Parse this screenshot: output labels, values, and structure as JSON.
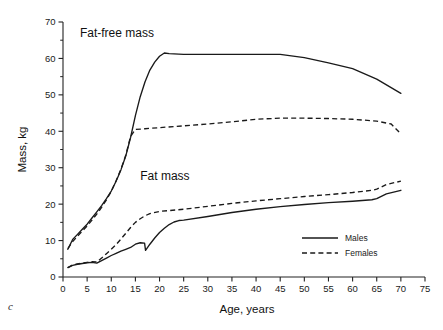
{
  "figure": {
    "panel_label": "c"
  },
  "chart_data": {
    "type": "line",
    "title": "",
    "xlabel": "Age, years",
    "ylabel": "Mass, kg",
    "xlim": [
      0,
      75
    ],
    "ylim": [
      0,
      70
    ],
    "x_major_ticks": [
      0,
      5,
      10,
      15,
      20,
      25,
      30,
      35,
      40,
      45,
      50,
      55,
      60,
      65,
      70,
      75
    ],
    "y_major_ticks": [
      0,
      10,
      20,
      30,
      40,
      50,
      60,
      70
    ],
    "y_minor_ticks": [
      5,
      15,
      25,
      35,
      45,
      55,
      65
    ],
    "grid": false,
    "legend_position": "bottom-right",
    "legend": [
      {
        "name": "Males",
        "style": "solid"
      },
      {
        "name": "Females",
        "style": "dashed"
      }
    ],
    "annotations": [
      {
        "text": "Fat-free mass",
        "x": 3.5,
        "y": 66.0
      },
      {
        "text": "Fat mass",
        "x": 16.0,
        "y": 26.5
      }
    ],
    "series": [
      {
        "name": "Fat-free mass, Males",
        "group": "Fat-free mass",
        "sex": "Males",
        "style": "solid",
        "x": [
          1,
          2,
          3,
          4,
          5,
          6,
          7,
          8,
          9,
          10,
          11,
          12,
          13,
          14,
          15,
          16,
          17,
          18,
          19,
          20,
          21,
          22,
          25,
          30,
          35,
          40,
          45,
          50,
          55,
          60,
          65,
          70
        ],
        "y": [
          7.6,
          10.3,
          11.7,
          13.1,
          14.5,
          16.2,
          17.9,
          19.6,
          21.5,
          23.6,
          26.3,
          29.4,
          33.2,
          38.3,
          44.3,
          49.5,
          53.6,
          56.8,
          59.0,
          60.6,
          61.5,
          61.3,
          61.1,
          61.1,
          61.1,
          61.1,
          61.1,
          60.2,
          58.8,
          57.2,
          54.3,
          50.4
        ]
      },
      {
        "name": "Fat-free mass, Females",
        "group": "Fat-free mass",
        "sex": "Females",
        "style": "dashed",
        "x": [
          1,
          2,
          3,
          4,
          5,
          6,
          7,
          8,
          9,
          10,
          11,
          12,
          13,
          14,
          15,
          17,
          20,
          25,
          30,
          35,
          40,
          45,
          50,
          55,
          60,
          65,
          68,
          70
        ],
        "y": [
          7.8,
          9.7,
          11.2,
          12.6,
          14.0,
          15.6,
          17.3,
          19.1,
          21.2,
          23.5,
          26.4,
          29.6,
          33.4,
          38.6,
          40.5,
          40.7,
          41.0,
          41.5,
          42.0,
          42.6,
          43.3,
          43.6,
          43.6,
          43.5,
          43.3,
          42.8,
          42.0,
          39.3
        ]
      },
      {
        "name": "Fat mass, Males",
        "group": "Fat mass",
        "sex": "Males",
        "style": "solid",
        "x": [
          1,
          2,
          3,
          4,
          5,
          6,
          7,
          8,
          9,
          10,
          11,
          12,
          13,
          14,
          15,
          16,
          16.9,
          17.1,
          18,
          19,
          20,
          21,
          22,
          23,
          24,
          25,
          30,
          35,
          40,
          45,
          50,
          55,
          60,
          64,
          65,
          67,
          70
        ],
        "y": [
          2.6,
          3.2,
          3.5,
          3.7,
          3.9,
          4.0,
          3.8,
          4.5,
          5.2,
          5.9,
          6.5,
          7.1,
          7.6,
          8.1,
          9.0,
          9.4,
          9.3,
          7.3,
          9.0,
          10.7,
          12.2,
          13.4,
          14.4,
          15.1,
          15.5,
          15.6,
          16.6,
          17.7,
          18.6,
          19.3,
          19.9,
          20.4,
          20.8,
          21.2,
          21.5,
          22.8,
          23.8
        ]
      },
      {
        "name": "Fat mass, Females",
        "group": "Fat mass",
        "sex": "Females",
        "style": "dashed",
        "x": [
          1,
          2,
          3,
          4,
          5,
          6,
          7,
          8,
          9,
          10,
          11,
          12,
          13,
          14,
          15,
          16,
          17,
          18,
          20,
          25,
          30,
          35,
          40,
          45,
          50,
          55,
          60,
          64,
          65,
          67,
          70
        ],
        "y": [
          2.6,
          3.3,
          3.6,
          3.8,
          4.0,
          4.2,
          4.1,
          5.2,
          6.4,
          7.6,
          8.9,
          10.4,
          12.0,
          13.6,
          15.0,
          16.0,
          16.8,
          17.4,
          18.0,
          18.6,
          19.4,
          20.2,
          20.9,
          21.5,
          22.1,
          22.6,
          23.2,
          23.8,
          24.1,
          25.4,
          26.3
        ]
      }
    ]
  }
}
